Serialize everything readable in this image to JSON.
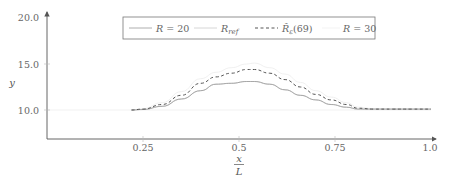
{
  "chart_data": {
    "type": "line",
    "title": "",
    "xlabel": "x/L",
    "xlabel_num": "x",
    "xlabel_den": "L",
    "ylabel": "y",
    "xlim": [
      0.0,
      1.0
    ],
    "ylim": [
      6.85,
      20.0
    ],
    "xticks": [
      0.25,
      0.5,
      0.75,
      1.0
    ],
    "xtick_labels": [
      "0.25",
      "0.5",
      "0.75",
      "1.0"
    ],
    "yticks": [
      10.0,
      15.0,
      20.0
    ],
    "ytick_labels": [
      "10.0",
      "15.0",
      "20.0"
    ],
    "grid": false,
    "legend_position": "top",
    "x": [
      0.22,
      0.25,
      0.3,
      0.35,
      0.4,
      0.44,
      0.48,
      0.52,
      0.54,
      0.58,
      0.62,
      0.66,
      0.7,
      0.74,
      0.78,
      0.81,
      0.85,
      0.9,
      0.95,
      1.0
    ],
    "series": [
      {
        "name": "R = 20",
        "style": "solid",
        "color": "#9a9a9a",
        "values": [
          10.0,
          10.05,
          10.4,
          11.2,
          12.1,
          12.8,
          12.9,
          13.1,
          13.1,
          12.8,
          12.2,
          11.6,
          11.1,
          10.6,
          10.3,
          10.1,
          10.1,
          10.1,
          10.1,
          10.1
        ]
      },
      {
        "name": "R_ref",
        "style": "solid",
        "color": "#cccccc",
        "values": [
          10.0,
          10.05,
          10.4,
          11.2,
          12.1,
          12.8,
          12.9,
          13.1,
          13.1,
          12.8,
          12.2,
          11.6,
          11.1,
          10.6,
          10.3,
          10.1,
          10.1,
          10.1,
          10.1,
          10.1
        ]
      },
      {
        "name": "R̂_ε(69)",
        "style": "dashed",
        "color": "#555555",
        "values": [
          10.0,
          10.1,
          10.6,
          11.6,
          12.9,
          13.6,
          14.0,
          14.4,
          14.4,
          14.0,
          13.3,
          12.5,
          11.7,
          11.1,
          10.6,
          10.2,
          10.1,
          10.1,
          10.1,
          10.1
        ]
      },
      {
        "name": "R = 30",
        "style": "solid",
        "color": "#ececec",
        "values": [
          10.0,
          10.15,
          10.8,
          12.0,
          13.4,
          14.1,
          14.6,
          15.0,
          15.1,
          14.6,
          13.9,
          13.0,
          12.1,
          11.4,
          10.8,
          10.3,
          10.15,
          10.1,
          10.1,
          10.1
        ]
      }
    ]
  },
  "legend": {
    "items": [
      {
        "label": "R = 20",
        "style": "solid",
        "color": "#9a9a9a"
      },
      {
        "label": "R_ref",
        "style": "solid",
        "color": "#cccccc"
      },
      {
        "label": "R̂ε(69)",
        "style": "dashed",
        "color": "#555555"
      },
      {
        "label": "R = 30",
        "style": "solid",
        "color": "#ececec"
      }
    ]
  }
}
